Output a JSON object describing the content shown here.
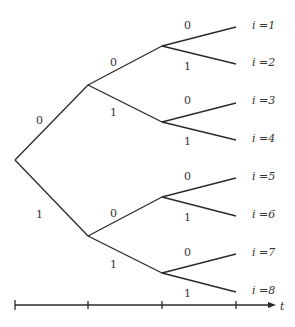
{
  "diagram": {
    "type": "binary-tree",
    "root": {
      "x": 15,
      "y": 160
    },
    "edge_labels": {
      "l0_up": "0",
      "l0_down": "1",
      "l1a_up": "0",
      "l1a_down": "1",
      "l1b_up": "0",
      "l1b_down": "1",
      "l2a_up": "0",
      "l2a_down": "1",
      "l2b_up": "0",
      "l2b_down": "1",
      "l2c_up": "0",
      "l2c_down": "1",
      "l2d_up": "0",
      "l2d_down": "1"
    },
    "leaves": [
      "i =1",
      "i =2",
      "i =3",
      "i =4",
      "i =5",
      "i =6",
      "i =7",
      "i =8"
    ],
    "axis": {
      "label": "t",
      "ticks": 4
    }
  }
}
